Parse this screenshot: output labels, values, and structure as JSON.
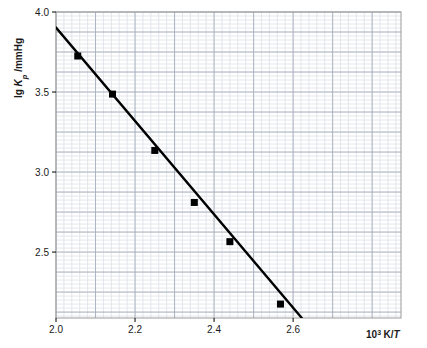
{
  "chart_data": {
    "type": "scatter",
    "title": "",
    "subtitle": "",
    "xlabel": "10³ K/T",
    "ylabel": "lg Kp /mmHg",
    "xlabel_parts": {
      "base": "10",
      "exponent": "3",
      "unit": "K/",
      "italic": "T"
    },
    "ylabel_parts": {
      "prefix": "lg ",
      "italic": "K",
      "sub": "p",
      "suffix": " /mmHg"
    },
    "xlim": [
      2.0,
      2.873
    ],
    "ylim": [
      2.088,
      4.0
    ],
    "xticks": [
      2.0,
      2.2,
      2.4,
      2.6
    ],
    "xticklabels": [
      "2.0",
      "2.2",
      "2.4",
      "2.6"
    ],
    "yticks": [
      2.5,
      3.0,
      3.5,
      4.0
    ],
    "yticklabels": [
      "2.5",
      "3.0",
      "3.5",
      "4.0"
    ],
    "grid": true,
    "grid_style": "graph-paper",
    "grid_minor_step_x": 0.02,
    "grid_minor_step_y": 0.025,
    "grid_major_step_x": 0.1,
    "grid_major_step_y": 0.125,
    "legend": null,
    "legend_position": "none",
    "marker_style": "filled-square",
    "marker_color": "#000000",
    "line_color": "#000000",
    "line_width": 2,
    "points": [
      {
        "x": 2.055,
        "y": 3.725
      },
      {
        "x": 2.143,
        "y": 3.487
      },
      {
        "x": 2.25,
        "y": 3.135
      },
      {
        "x": 2.35,
        "y": 2.81
      },
      {
        "x": 2.44,
        "y": 2.565
      },
      {
        "x": 2.568,
        "y": 2.175
      }
    ],
    "fit_line": {
      "x_start": 2.0,
      "y_start": 3.903,
      "x_end": 2.622,
      "y_end": 2.088
    },
    "colors": {
      "ink": "#000000",
      "frame": "#9a9a9a",
      "grid_minor": "#d8dde4",
      "grid_major": "#a8b0bd",
      "background": "#ffffff"
    }
  }
}
